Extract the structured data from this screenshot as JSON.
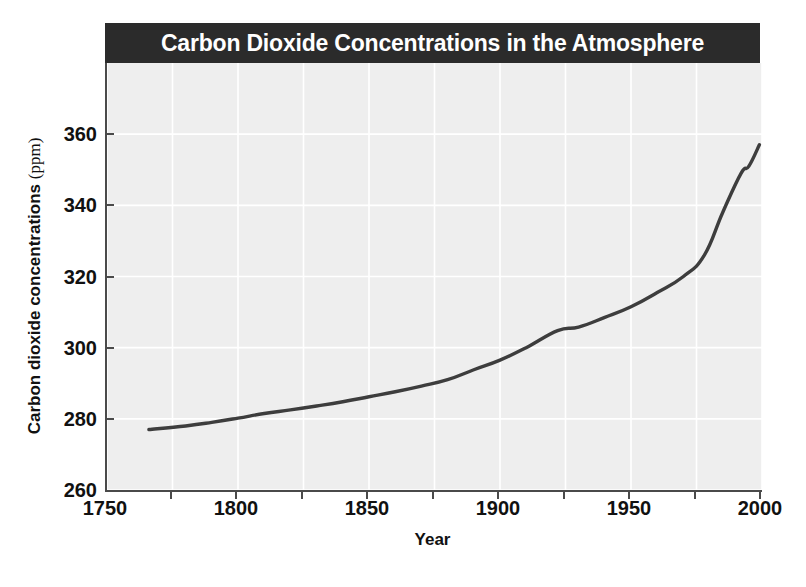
{
  "figure": {
    "title": "Carbon Dioxide Concentrations in the Atmosphere",
    "title_bar_color": "#2b2b2b",
    "title_text_color": "#ffffff",
    "plot_background_color": "#eeeeee",
    "gridline_color": "#ffffff",
    "axis_color": "#4a4a4a",
    "line_color": "#3d3d3d"
  },
  "chart_data": {
    "type": "line",
    "title": "Carbon Dioxide Concentrations in the Atmosphere",
    "xlabel": "Year",
    "ylabel": "Carbon dioxide concentrations (ppm)",
    "ylabel_main": "Carbon dioxide concentrations",
    "ylabel_unit": "(ppm)",
    "xlim": [
      1750,
      2000
    ],
    "ylim": [
      260,
      380
    ],
    "grid": true,
    "legend": "none",
    "x_ticks": [
      1750,
      1800,
      1850,
      1900,
      1950,
      2000
    ],
    "x_tick_labels": [
      "1750",
      "1800",
      "1850",
      "1900",
      "1950",
      "2000"
    ],
    "x_minor_ticks": [
      1775,
      1825,
      1875,
      1925,
      1975
    ],
    "y_ticks": [
      260,
      280,
      300,
      320,
      340,
      360
    ],
    "y_tick_labels": [
      "260",
      "280",
      "300",
      "320",
      "340",
      "360"
    ],
    "series": [
      {
        "name": "Atmospheric CO2 concentration",
        "x": [
          1766,
          1780,
          1790,
          1800,
          1810,
          1820,
          1830,
          1840,
          1850,
          1860,
          1870,
          1880,
          1890,
          1900,
          1910,
          1922,
          1930,
          1940,
          1950,
          1960,
          1970,
          1978,
          1985,
          1992,
          1995,
          1999
        ],
        "y": [
          277.0,
          278.0,
          279.0,
          280.2,
          281.5,
          282.5,
          283.6,
          284.8,
          286.2,
          287.6,
          289.2,
          291.0,
          293.8,
          296.5,
          300.0,
          304.8,
          305.8,
          308.5,
          311.5,
          315.5,
          320.0,
          326.0,
          338.0,
          349.0,
          351.0,
          357.0
        ]
      }
    ]
  }
}
